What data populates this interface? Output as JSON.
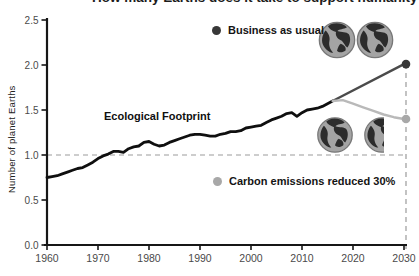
{
  "header": {
    "title": "How many Earths does it take to support humanity?",
    "title_visibility": "cropped at top edge"
  },
  "chart_data": {
    "type": "line",
    "title": "How many Earths does it take to support humanity?",
    "xlabel": "",
    "ylabel": "Number of planet Earths",
    "xlim": [
      1960,
      2030
    ],
    "ylim": [
      0,
      2.5
    ],
    "x_ticks": [
      "1960",
      "1970",
      "1980",
      "1990",
      "2000",
      "2010",
      "2020",
      "2030"
    ],
    "y_ticks": [
      "0.0",
      "0.5",
      "1.0",
      "1.5",
      "2.0",
      "2.5"
    ],
    "grid": false,
    "reference_lines": {
      "horizontal_y": 1.0,
      "vertical_x": 2030
    },
    "annotation": "Ecological Footprint",
    "legend": [
      {
        "label": "Business as usual",
        "color": "#383838"
      },
      {
        "label": "Carbon emissions reduced 30%",
        "color": "#a8a8a8"
      }
    ],
    "series": [
      {
        "name": "Ecological Footprint",
        "color": "#0f0f0f",
        "width": 2.8,
        "endpoint_dot": false,
        "x": [
          1960,
          1961,
          1962,
          1963,
          1964,
          1965,
          1966,
          1967,
          1968,
          1969,
          1970,
          1971,
          1972,
          1973,
          1974,
          1975,
          1976,
          1977,
          1978,
          1979,
          1980,
          1981,
          1982,
          1983,
          1984,
          1985,
          1986,
          1987,
          1988,
          1989,
          1990,
          1991,
          1992,
          1993,
          1994,
          1995,
          1996,
          1997,
          1998,
          1999,
          2000,
          2001,
          2002,
          2003,
          2004,
          2005,
          2006,
          2007,
          2008,
          2009,
          2010,
          2011,
          2012,
          2013,
          2014,
          2015,
          2016
        ],
        "y": [
          0.75,
          0.76,
          0.77,
          0.79,
          0.81,
          0.83,
          0.85,
          0.86,
          0.89,
          0.92,
          0.96,
          0.99,
          1.01,
          1.04,
          1.04,
          1.03,
          1.07,
          1.09,
          1.1,
          1.14,
          1.15,
          1.12,
          1.1,
          1.11,
          1.14,
          1.16,
          1.18,
          1.2,
          1.22,
          1.23,
          1.23,
          1.22,
          1.21,
          1.21,
          1.23,
          1.24,
          1.26,
          1.26,
          1.27,
          1.3,
          1.31,
          1.32,
          1.33,
          1.36,
          1.39,
          1.41,
          1.43,
          1.46,
          1.47,
          1.43,
          1.47,
          1.5,
          1.51,
          1.52,
          1.54,
          1.57,
          1.6
        ]
      },
      {
        "name": "Business as usual",
        "color": "#4b4b4b",
        "width": 2.4,
        "endpoint_dot": true,
        "dot_color": "#383838",
        "x": [
          2016,
          2030
        ],
        "y": [
          1.6,
          2.01
        ]
      },
      {
        "name": "Carbon emissions reduced 30%",
        "color": "#b9b9b9",
        "width": 2.4,
        "endpoint_dot": true,
        "dot_color": "#a8a8a8",
        "x": [
          2016,
          2018,
          2020,
          2022,
          2024,
          2026,
          2028,
          2030
        ],
        "y": [
          1.6,
          1.61,
          1.57,
          1.53,
          1.49,
          1.45,
          1.42,
          1.4
        ]
      }
    ],
    "icons": [
      "earth-globe-icon (x2, business-as-usual scenario ≈ 2 Earths)",
      "earth-globe-icon (1 full + partial, reduced scenario ≈ 1.4 Earths)"
    ]
  }
}
